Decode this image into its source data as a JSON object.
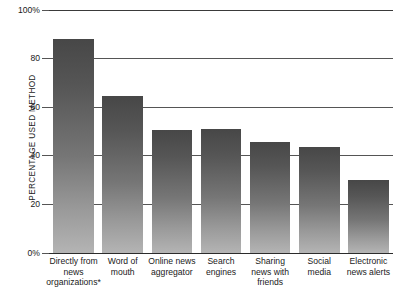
{
  "chart_data": {
    "type": "bar",
    "title": "",
    "subtitle": "",
    "xlabel": "",
    "ylabel": "PERCENTAGE USED METHOD",
    "ylim": [
      0,
      100
    ],
    "grid": true,
    "legend": false,
    "orientation": "vertical",
    "categories": [
      "Directly from news organizations*",
      "Word of mouth",
      "Online news aggregator",
      "Search engines",
      "Sharing news with friends",
      "Social media",
      "Electronic news alerts"
    ],
    "values": [
      88,
      64.5,
      50.5,
      51,
      45.5,
      43.5,
      30
    ],
    "ytick_values": [
      100,
      80,
      60,
      40,
      20,
      0
    ],
    "ytick_labels": [
      "100%",
      "80",
      "60",
      "40",
      "20",
      "0%"
    ],
    "annotations": [
      "* footnote marker on first category"
    ],
    "colors": {
      "bar_top": "#474747",
      "bar_bottom": "#b4b4b4",
      "gridline": "#555555",
      "axis": "#2b2b2b",
      "text": "#1a1a1a",
      "background": "#ffffff"
    }
  },
  "category_lines": [
    [
      "Directly from",
      "news",
      "organizations*"
    ],
    [
      "Word of",
      "mouth"
    ],
    [
      "Online news",
      "aggregator"
    ],
    [
      "Search",
      "engines"
    ],
    [
      "Sharing",
      "news with",
      "friends"
    ],
    [
      "Social",
      "media"
    ],
    [
      "Electronic",
      "news alerts"
    ]
  ]
}
